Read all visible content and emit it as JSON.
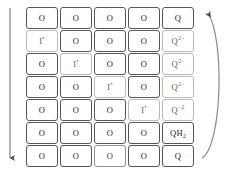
{
  "diagram": {
    "colors": {
      "cell_border": "#55565a",
      "cell_border_faint": "#b9babd",
      "text": "#1b1b1b",
      "arrow": "#6a6b6e",
      "background": "#ffffff"
    },
    "left_arrow": {
      "name": "time-progression-arrow",
      "direction": "down",
      "label": ""
    },
    "right_arrow": {
      "name": "recycle-arrow",
      "direction": "up-curved",
      "label": ""
    },
    "grid": {
      "rows": 7,
      "columns": 5,
      "column_labels": [
        "col-1",
        "col-2",
        "col-3",
        "col-4",
        "col-5"
      ],
      "cells": [
        [
          {
            "text": "O",
            "style": "normal"
          },
          {
            "text": "O",
            "style": "normal"
          },
          {
            "text": "O",
            "style": "normal"
          },
          {
            "text": "O",
            "style": "normal"
          },
          {
            "text": "Q",
            "style": "normal"
          }
        ],
        [
          {
            "text": "I•",
            "style": "faint"
          },
          {
            "text": "O",
            "style": "normal"
          },
          {
            "text": "O",
            "style": "normal"
          },
          {
            "text": "O",
            "style": "normal"
          },
          {
            "text": "Q2−",
            "style": "faint"
          }
        ],
        [
          {
            "text": "O",
            "style": "normal"
          },
          {
            "text": "I•",
            "style": "faint"
          },
          {
            "text": "O",
            "style": "normal"
          },
          {
            "text": "O",
            "style": "normal"
          },
          {
            "text": "Q2−",
            "style": "faint"
          }
        ],
        [
          {
            "text": "O",
            "style": "normal"
          },
          {
            "text": "O",
            "style": "normal"
          },
          {
            "text": "I•",
            "style": "faint"
          },
          {
            "text": "O",
            "style": "normal"
          },
          {
            "text": "Q2−",
            "style": "faint"
          }
        ],
        [
          {
            "text": "O",
            "style": "normal"
          },
          {
            "text": "O",
            "style": "normal"
          },
          {
            "text": "O",
            "style": "normal"
          },
          {
            "text": "I•",
            "style": "faint"
          },
          {
            "text": "Q−2",
            "style": "faint"
          }
        ],
        [
          {
            "text": "O",
            "style": "normal"
          },
          {
            "text": "O",
            "style": "normal"
          },
          {
            "text": "O",
            "style": "normal"
          },
          {
            "text": "O",
            "style": "normal"
          },
          {
            "text": "QH2",
            "style": "normal"
          }
        ],
        [
          {
            "text": "O",
            "style": "normal"
          },
          {
            "text": "O",
            "style": "normal"
          },
          {
            "text": "O",
            "style": "mid"
          },
          {
            "text": "O",
            "style": "normal"
          },
          {
            "text": "Q",
            "style": "normal"
          }
        ]
      ]
    }
  }
}
